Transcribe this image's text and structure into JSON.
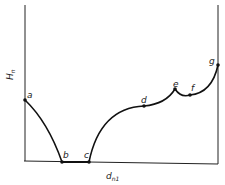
{
  "diagram": {
    "y_axis_label": "H",
    "y_axis_sub": "n",
    "x_axis_label": "d",
    "x_axis_sub": "n1",
    "points": [
      {
        "label": "a"
      },
      {
        "label": "b"
      },
      {
        "label": "c"
      },
      {
        "label": "d"
      },
      {
        "label": "e"
      },
      {
        "label": "f"
      },
      {
        "label": "g"
      }
    ],
    "colors": {
      "line": "#111111",
      "background": "#ffffff"
    }
  }
}
